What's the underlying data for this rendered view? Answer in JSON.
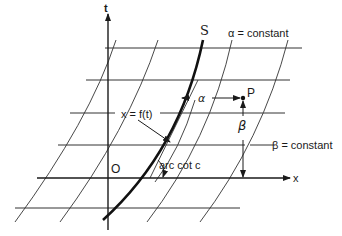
{
  "diagram": {
    "axes": {
      "t_label": "t",
      "x_label": "x",
      "origin_label": "O"
    },
    "curve": {
      "name_label": "S",
      "equation_label": "x = f(t)"
    },
    "labels": {
      "alpha_constant": "α = constant",
      "beta_constant": "β = constant",
      "alpha": "α",
      "beta": "β",
      "point": "P",
      "angle": "arc cot c"
    },
    "colors": {
      "ink": "#1a1a1a",
      "background": "#ffffff"
    }
  }
}
